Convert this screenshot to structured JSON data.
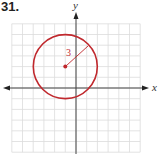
{
  "problem_number": "31.",
  "graph": {
    "x_axis_label": "x",
    "y_axis_label": "y",
    "grid_range": {
      "xmin": -6,
      "xmax": 6,
      "ymin": -6,
      "ymax": 6
    },
    "grid_step": 1
  },
  "circle": {
    "center": [
      -1,
      2
    ],
    "radius": 3,
    "radius_label": "3",
    "color": "#c0282d"
  },
  "colors": {
    "grid": "#d9d9d9",
    "axis": "#444444",
    "curve": "#c0282d"
  }
}
